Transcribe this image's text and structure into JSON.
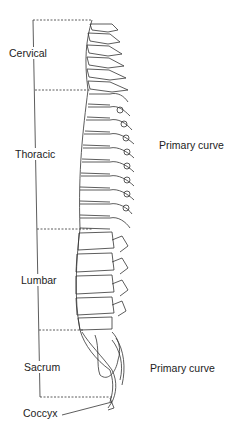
{
  "diagram": {
    "type": "anatomical illustration",
    "regions": [
      {
        "label": "Cervical"
      },
      {
        "label": "Thoracic"
      },
      {
        "label": "Lumbar"
      },
      {
        "label": "Sacrum"
      },
      {
        "label": "Coccyx"
      }
    ],
    "curve_labels": [
      {
        "label": "Primary curve"
      },
      {
        "label": "Primary curve"
      }
    ],
    "colors": {
      "line": "#333333",
      "background": "#ffffff"
    }
  }
}
